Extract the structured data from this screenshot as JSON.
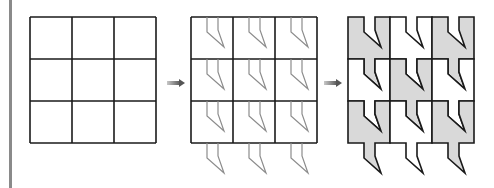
{
  "figure": {
    "grid": {
      "rows": 3,
      "cols": 3,
      "cell_size": 42
    },
    "panels": [
      {
        "id": "step-1",
        "label": "Plain 3x3 square grid",
        "origin": [
          30,
          17
        ]
      },
      {
        "id": "step-2",
        "label": "Grid with notch outlines cut from top and translated to bottom",
        "origin": [
          191,
          17
        ]
      },
      {
        "id": "step-3",
        "label": "Resulting tessellation with alternating shaded tiles",
        "origin": [
          348,
          17
        ]
      }
    ],
    "notch": [
      [
        16,
        0
      ],
      [
        16,
        15
      ],
      [
        33,
        30
      ],
      [
        27,
        13
      ],
      [
        27,
        0
      ]
    ],
    "shaded_tiles": [
      [
        0,
        0
      ],
      [
        0,
        2
      ],
      [
        1,
        1
      ],
      [
        2,
        0
      ],
      [
        2,
        2
      ]
    ],
    "arrows": [
      {
        "id": "arrow-1",
        "x1": 167,
        "x2": 185,
        "y": 83
      },
      {
        "id": "arrow-2",
        "x1": 324,
        "x2": 342,
        "y": 83
      }
    ],
    "colors": {
      "grid_line": "#1a1a1a",
      "notch_line": "#8c8c8c",
      "tile_fill": "#d9d9d9",
      "arrow": "#707070",
      "side_bar": "#8a8a8a"
    }
  }
}
